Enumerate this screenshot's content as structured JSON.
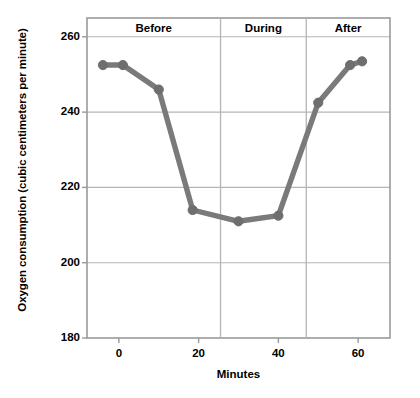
{
  "chart_data": {
    "type": "line",
    "title": "",
    "xlabel": "Minutes",
    "ylabel": "Oxygen consumption (cubic centimeters per minute)",
    "xlim": [
      -8,
      68
    ],
    "ylim": [
      180,
      265
    ],
    "xticks": [
      0,
      20,
      40,
      60
    ],
    "xtick_labels": [
      "0",
      "20",
      "40",
      "60"
    ],
    "yticks": [
      180,
      200,
      220,
      240,
      260
    ],
    "ytick_labels": [
      "180",
      "200",
      "220",
      "240",
      "260"
    ],
    "grid": "horizontal-gridlines-at-yticks",
    "legend": "none",
    "series": [
      {
        "name": "Oxygen consumption",
        "color": "#7a7a7a",
        "marker": "circle",
        "x": [
          -4,
          1,
          10,
          18.5,
          30,
          40,
          50,
          58,
          61
        ],
        "y": [
          252.5,
          252.5,
          246,
          214,
          211,
          212.5,
          242.5,
          252.5,
          253.5
        ]
      }
    ],
    "annotations": [
      {
        "label": "Before",
        "x_center": 10,
        "region": [
          -8,
          25.5
        ]
      },
      {
        "label": "During",
        "x_center": 43,
        "region": [
          25.5,
          47
        ]
      },
      {
        "label": "After",
        "x_center": 57,
        "region": [
          47,
          68
        ]
      }
    ],
    "dividers": [
      25.5,
      47
    ]
  },
  "axes": {
    "y_title": "Oxygen consumption (cubic centimeters per minute)",
    "x_title": "Minutes",
    "y_labels": [
      "260",
      "240",
      "220",
      "200",
      "180"
    ],
    "x_labels": [
      "0",
      "20",
      "40",
      "60"
    ]
  },
  "phases": {
    "before": "Before",
    "during": "During",
    "after": "After"
  },
  "colors": {
    "line": "#7a7a7a",
    "marker": "#6e6e6e",
    "axis": "#9a9a9a",
    "grid": "#b5b5b5",
    "text": "#000000",
    "background": "#ffffff"
  }
}
